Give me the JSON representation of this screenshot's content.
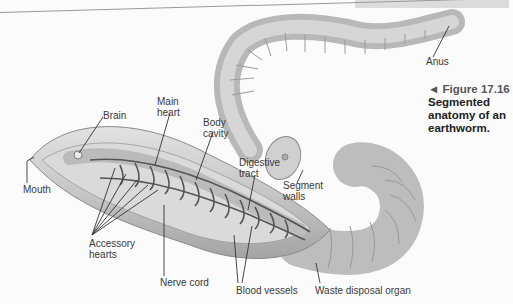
{
  "figure": {
    "arrow_glyph": "◄",
    "number_label": "Figure 17.16",
    "title": "Segmented anatomy of an earthworm."
  },
  "labels": {
    "anus": "Anus",
    "brain": "Brain",
    "main_heart": "Main heart",
    "body_cavity": "Body cavity",
    "digestive_tract": "Digestive tract",
    "segment_walls": "Segment walls",
    "mouth": "Mouth",
    "accessory_hearts": "Accessory hearts",
    "nerve_cord": "Nerve cord",
    "blood_vessels": "Blood vessels",
    "waste_disposal_organ": "Waste disposal organ"
  },
  "colors": {
    "worm_body": "#c8c8c8",
    "worm_shadow": "#9c9c9c",
    "vessels": "#555555",
    "text": "#3a3a3a"
  }
}
